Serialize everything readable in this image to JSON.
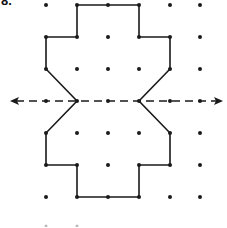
{
  "figure": {
    "label": "8.",
    "stroke_color": "#1a1a1a",
    "grid": {
      "columns_x": [
        46,
        77,
        108,
        139,
        170,
        200
      ],
      "rows_y": [
        5,
        37,
        69,
        101,
        133,
        165,
        197
      ],
      "dots": [
        [
          46,
          5
        ],
        [
          170,
          5
        ],
        [
          200,
          5
        ],
        [
          108,
          37
        ],
        [
          200,
          37
        ],
        [
          77,
          69
        ],
        [
          108,
          69
        ],
        [
          139,
          69
        ],
        [
          200,
          69
        ],
        [
          46,
          101
        ],
        [
          108,
          101
        ],
        [
          170,
          101
        ],
        [
          200,
          101
        ],
        [
          77,
          133
        ],
        [
          108,
          133
        ],
        [
          139,
          133
        ],
        [
          200,
          133
        ],
        [
          108,
          165
        ],
        [
          200,
          165
        ],
        [
          46,
          197
        ],
        [
          170,
          197
        ],
        [
          200,
          197
        ]
      ],
      "faint_dots": [
        [
          46,
          226
        ],
        [
          77,
          226
        ]
      ]
    },
    "shape": {
      "name": "symmetric polygon",
      "vertices": [
        [
          77,
          5
        ],
        [
          108,
          5
        ],
        [
          139,
          5
        ],
        [
          139,
          37
        ],
        [
          170,
          37
        ],
        [
          170,
          69
        ],
        [
          139,
          101
        ],
        [
          170,
          133
        ],
        [
          170,
          165
        ],
        [
          139,
          165
        ],
        [
          139,
          197
        ],
        [
          108,
          197
        ],
        [
          77,
          197
        ],
        [
          77,
          165
        ],
        [
          46,
          165
        ],
        [
          46,
          133
        ],
        [
          77,
          101
        ],
        [
          46,
          69
        ],
        [
          46,
          37
        ],
        [
          77,
          37
        ]
      ]
    },
    "axis": {
      "name": "line of symmetry",
      "y": 101,
      "x_start": 10,
      "x_end": 223,
      "style": "dashed",
      "arrows": "both"
    }
  }
}
